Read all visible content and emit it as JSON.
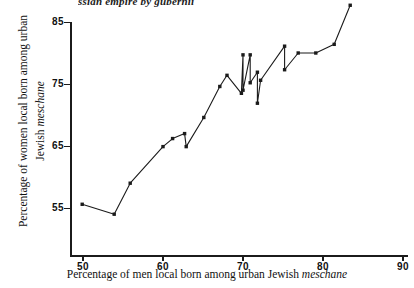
{
  "figure": {
    "top_caption_fragment": "ssian empire by gubernii",
    "background_color": "#ffffff",
    "ink_color": "#1b1b1b"
  },
  "axes": {
    "y_title_line1": "Percentage of women local born among urban",
    "y_title_line2_plain": "Jewish ",
    "y_title_line2_italic": "meschane",
    "x_title_plain_prefix": "Percentage of men local born among urban Jewish ",
    "x_title_italic": "meschane",
    "y_ticks": [
      "55",
      "65",
      "75",
      "85"
    ],
    "x_ticks": [
      "50",
      "60",
      "70",
      "80",
      "90"
    ]
  },
  "chart_data": {
    "type": "line",
    "title": "",
    "subtitle": "",
    "xlabel": "Percentage of men local born among urban Jewish meschane",
    "ylabel": "Percentage of women local born among urban Jewish meschane",
    "xlim": [
      46,
      92
    ],
    "ylim": [
      49.5,
      88.5
    ],
    "xticks": [
      50,
      60,
      70,
      80,
      90
    ],
    "yticks": [
      55,
      65,
      75,
      85
    ],
    "grid": false,
    "legend": false,
    "marker": "filled-square",
    "series": [
      {
        "name": "gubernii",
        "x": [
          49.9,
          53.9,
          55.9,
          60.0,
          61.2,
          62.7,
          62.9,
          65.1,
          67.1,
          68.0,
          69.8,
          70.0,
          70.0,
          70.9,
          70.9,
          71.8,
          71.8,
          72.2,
          75.2,
          75.2,
          76.9,
          79.1,
          81.4,
          83.4
        ],
        "y": [
          55.6,
          54.0,
          59.0,
          64.9,
          66.2,
          67.0,
          64.9,
          69.6,
          74.6,
          76.4,
          73.5,
          79.7,
          74.0,
          79.7,
          75.2,
          76.9,
          71.9,
          75.6,
          81.1,
          77.3,
          80.0,
          80.0,
          81.4,
          87.7
        ]
      }
    ]
  }
}
